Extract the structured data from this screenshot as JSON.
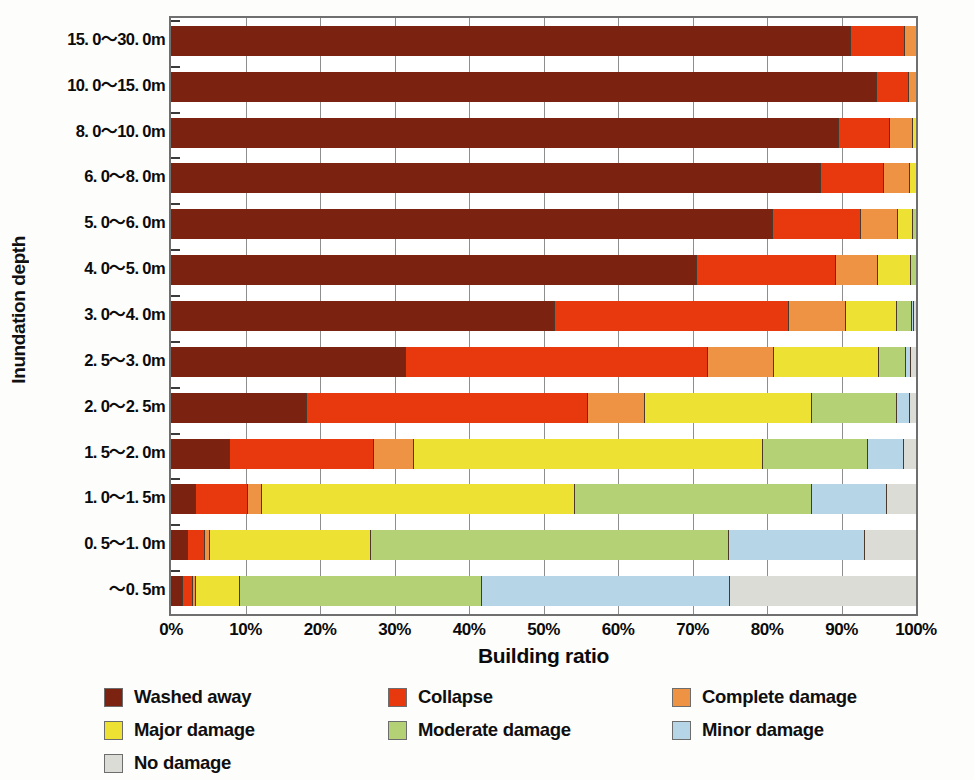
{
  "axes": {
    "y_title": "Inundation depth",
    "x_title": "Building ratio",
    "x_ticks": [
      "0%",
      "10%",
      "20%",
      "30%",
      "40%",
      "50%",
      "60%",
      "70%",
      "80%",
      "90%",
      "100%"
    ]
  },
  "legend": {
    "items": [
      {
        "label": "Washed away",
        "color": "#7B2211",
        "icon": "legend-swatch-washed-away"
      },
      {
        "label": "Collapse",
        "color": "#E8380D",
        "icon": "legend-swatch-collapse"
      },
      {
        "label": "Complete damage",
        "color": "#EE9243",
        "icon": "legend-swatch-complete-damage"
      },
      {
        "label": "Major damage",
        "color": "#EDE234",
        "icon": "legend-swatch-major-damage"
      },
      {
        "label": "Moderate damage",
        "color": "#B4D275",
        "icon": "legend-swatch-moderate-damage"
      },
      {
        "label": "Minor damage",
        "color": "#B6D6E8",
        "icon": "legend-swatch-minor-damage"
      },
      {
        "label": "No damage",
        "color": "#DCDCD6",
        "icon": "legend-swatch-no-damage"
      }
    ]
  },
  "chart_data": {
    "type": "bar",
    "orientation": "horizontal",
    "stacked": true,
    "stacked_normalized": true,
    "title": "",
    "xlabel": "Building ratio",
    "ylabel": "Inundation depth",
    "xlim": [
      0,
      100
    ],
    "xticks": [
      0,
      10,
      20,
      30,
      40,
      50,
      60,
      70,
      80,
      90,
      100
    ],
    "grid": true,
    "legend_position": "bottom",
    "categories": [
      "15.0~30.0m",
      "10.0~15.0m",
      "8.0~10.0m",
      "6.0~8.0m",
      "5.0~6.0m",
      "4.0~5.0m",
      "3.0~4.0m",
      "2.5~3.0m",
      "2.0~2.5m",
      "1.5~2.0m",
      "1.0~1.5m",
      "0.5~1.0m",
      "~0.5m"
    ],
    "series": [
      {
        "name": "Washed away",
        "color": "#7B2211",
        "values": [
          91.3,
          94.8,
          89.6,
          87.3,
          80.8,
          70.6,
          51.5,
          31.5,
          18.3,
          7.9,
          3.4,
          2.3,
          1.6
        ]
      },
      {
        "name": "Collapse",
        "color": "#E8380D",
        "values": [
          7.2,
          4.3,
          6.9,
          8.4,
          11.8,
          18.7,
          31.4,
          40.6,
          37.7,
          19.3,
          6.9,
          2.3,
          1.3
        ]
      },
      {
        "name": "Complete damage",
        "color": "#EE9243",
        "values": [
          1.5,
          0.9,
          3.1,
          3.5,
          5.0,
          5.6,
          7.7,
          8.9,
          7.6,
          5.4,
          1.9,
          0.6,
          0.4
        ]
      },
      {
        "name": "Major damage",
        "color": "#EDE234",
        "values": [
          0.0,
          0.0,
          0.4,
          0.8,
          2.0,
          4.4,
          6.9,
          14.1,
          22.4,
          46.8,
          42.0,
          21.6,
          5.9
        ]
      },
      {
        "name": "Moderate damage",
        "color": "#B4D275",
        "values": [
          0.0,
          0.0,
          0.0,
          0.0,
          0.4,
          0.7,
          2.0,
          3.6,
          11.4,
          14.2,
          31.9,
          48.1,
          32.5
        ]
      },
      {
        "name": "Minor damage",
        "color": "#B6D6E8",
        "values": [
          0.0,
          0.0,
          0.0,
          0.0,
          0.0,
          0.0,
          0.3,
          0.7,
          1.8,
          4.8,
          10.0,
          18.2,
          33.3
        ]
      },
      {
        "name": "No damage",
        "color": "#DCDCD6",
        "values": [
          0.0,
          0.0,
          0.0,
          0.0,
          0.0,
          0.0,
          0.2,
          0.6,
          0.8,
          1.6,
          3.9,
          6.9,
          25.0
        ]
      }
    ]
  }
}
